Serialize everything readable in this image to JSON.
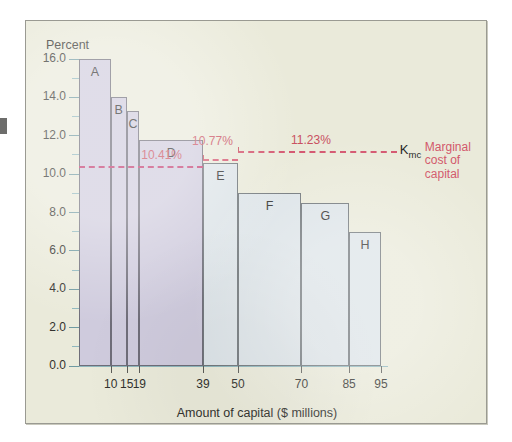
{
  "figure": {
    "background_color": "#eaeada",
    "frame_color": "#9a9a92"
  },
  "axis": {
    "y_title": "Percent",
    "x_title": "Amount of capital ($ millions)",
    "y_ticks": [
      "16.0",
      "14.0",
      "12.0",
      "10.0",
      "8.0",
      "6.0",
      "4.0",
      "2.0",
      "0.0"
    ],
    "x_ticks": [
      "10",
      "15",
      "19",
      "39",
      "50",
      "70",
      "85",
      "95"
    ]
  },
  "annotations": {
    "kmc_symbol": "K",
    "kmc_subscript": "mc",
    "legend_line_1": "Marginal",
    "legend_line_2": "cost of",
    "legend_line_3": "capital",
    "mc_1_label": "10.41%",
    "mc_2_label": "10.77%",
    "mc_3_label": "11.23%",
    "accent_color": "#c9505f",
    "group1_fill": "#cfcbdd",
    "group2_fill": "#dde4e8"
  },
  "chart_data": {
    "type": "bar",
    "title": "",
    "subtitle": "",
    "xlabel": "Amount of capital ($ millions)",
    "ylabel": "Percent",
    "ylim": [
      0.0,
      16.0
    ],
    "xlim": [
      0,
      100
    ],
    "y_major_step": 2.0,
    "y_minor_step": 1.0,
    "grid": false,
    "legend_position": "right",
    "orientation": "step-function",
    "bars": [
      {
        "label": "A",
        "x_start": 0,
        "x_end": 10,
        "value": 16.0,
        "group": 1
      },
      {
        "label": "B",
        "x_start": 10,
        "x_end": 15,
        "value": 14.0,
        "group": 1
      },
      {
        "label": "C",
        "x_start": 15,
        "x_end": 19,
        "value": 13.3,
        "group": 1
      },
      {
        "label": "D",
        "x_start": 19,
        "x_end": 39,
        "value": 11.8,
        "group": 1
      },
      {
        "label": "E",
        "x_start": 39,
        "x_end": 50,
        "value": 10.6,
        "group": 2
      },
      {
        "label": "F",
        "x_start": 50,
        "x_end": 70,
        "value": 9.0,
        "group": 2
      },
      {
        "label": "G",
        "x_start": 70,
        "x_end": 85,
        "value": 8.5,
        "group": 2
      },
      {
        "label": "H",
        "x_start": 85,
        "x_end": 95,
        "value": 7.0,
        "group": 2
      }
    ],
    "marginal_cost_lines": [
      {
        "label": "10.41%",
        "value": 10.41,
        "x_start": 0,
        "x_end": 39,
        "style": "dashed"
      },
      {
        "label": "10.77%",
        "value": 10.77,
        "x_start": 39,
        "x_end": 50,
        "style": "dashed"
      },
      {
        "label": "11.23%",
        "value": 11.23,
        "x_start": 50,
        "x_end": 100,
        "style": "dashed"
      }
    ]
  }
}
